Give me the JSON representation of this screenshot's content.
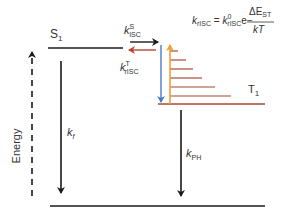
{
  "axis": {
    "label": "Energy"
  },
  "levels": {
    "s1": {
      "label": "S",
      "sub": "1"
    },
    "t1": {
      "label": "T",
      "sub": "1"
    },
    "ground": {
      "label": ""
    }
  },
  "rates": {
    "kisc": {
      "base": "k",
      "sup": "S",
      "sub": "ISC"
    },
    "krisc": {
      "base": "k",
      "sup": "T",
      "sub": "rISC"
    },
    "kf": {
      "base": "k",
      "sub": "f"
    },
    "kph": {
      "base": "k",
      "sub": "PH"
    }
  },
  "equation": {
    "lhs_base": "k",
    "lhs_sub": "rISC",
    "equals": " = ",
    "rhs_base": "k",
    "rhs_sup": "0",
    "rhs_sub": "rISC",
    "exp_base": "e",
    "exp_sign": "−",
    "numerator": "ΔE",
    "numerator_sub": "ST",
    "denominator": "kT"
  },
  "colors": {
    "line": "#1a1a1a",
    "risc_arrow": "#b5452e",
    "vibrational_rungs": "#a64a35",
    "thermal_up": "#f0a030",
    "relax_down": "#4a78c8"
  },
  "vibrational_rungs": [
    {
      "y": 51,
      "x2": 178
    },
    {
      "y": 60,
      "x2": 186
    },
    {
      "y": 69,
      "x2": 193
    },
    {
      "y": 78,
      "x2": 202
    },
    {
      "y": 87,
      "x2": 215
    },
    {
      "y": 96,
      "x2": 231
    }
  ]
}
